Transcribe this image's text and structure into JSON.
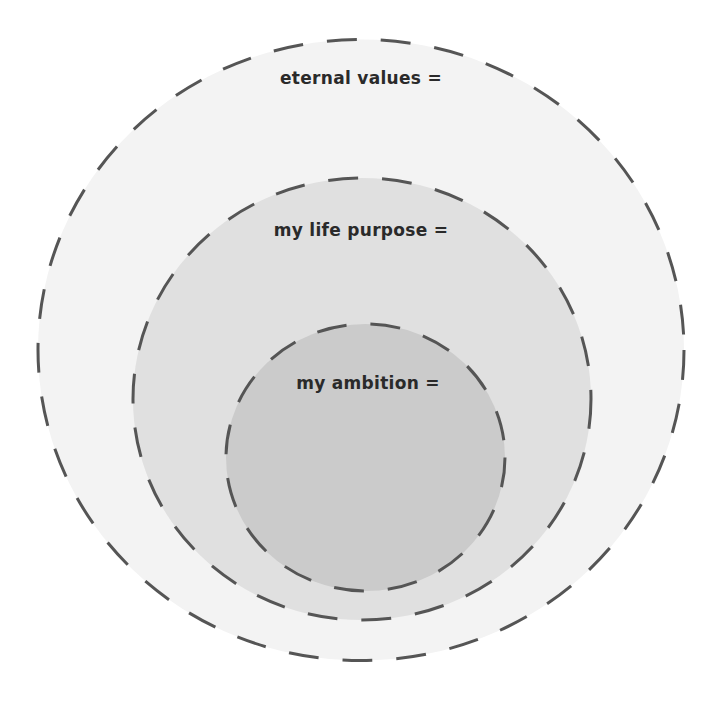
{
  "diagram": {
    "type": "nested-circles",
    "colors": {
      "stroke": "#555555",
      "outer_fill": "#f3f3f3",
      "middle_fill": "#e0e0e0",
      "inner_fill": "#cbcbcb",
      "text": "#2a2a2a"
    },
    "circles": [
      {
        "label": "eternal values ="
      },
      {
        "label": "my life purpose ="
      },
      {
        "label": "my ambition ="
      }
    ]
  }
}
